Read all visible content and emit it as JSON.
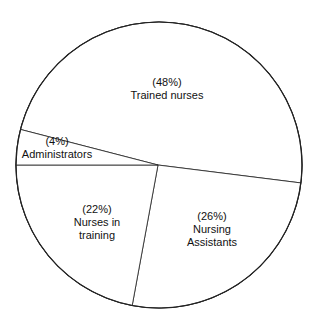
{
  "chart_data": {
    "type": "pie",
    "title": "",
    "slices": [
      {
        "label": "Trained nurses",
        "value": 48,
        "pct_label": "(48%)",
        "lines": [
          "Trained nurses"
        ]
      },
      {
        "label": "Nursing Assistants",
        "value": 26,
        "pct_label": "(26%)",
        "lines": [
          "Nursing",
          "Assistants"
        ]
      },
      {
        "label": "Nurses in training",
        "value": 22,
        "pct_label": "(22%)",
        "lines": [
          "Nurses in",
          "training"
        ]
      },
      {
        "label": "Administrators",
        "value": 4,
        "pct_label": "(4%)",
        "lines": [
          "Administrators"
        ]
      }
    ],
    "legend": "none",
    "colors": {
      "fill": "#ffffff",
      "stroke": "#222222",
      "text": "#111111"
    }
  }
}
